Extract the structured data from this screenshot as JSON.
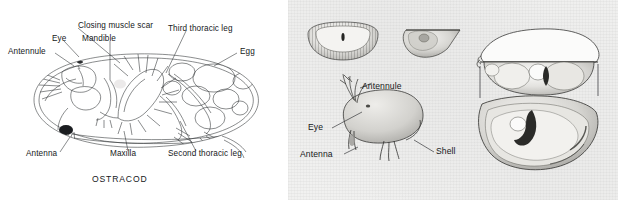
{
  "figure": {
    "caption": "OSTRACOD",
    "panels": [
      {
        "name": "anatomy-diagram",
        "kind": "line-drawing"
      },
      {
        "name": "shell-plate",
        "kind": "halftone-photo-plate"
      }
    ]
  },
  "left_panel": {
    "caption": "OSTRACOD",
    "labels": [
      {
        "id": "closing-muscle-scar",
        "text": "Closing muscle scar"
      },
      {
        "id": "eye",
        "text": "Eye"
      },
      {
        "id": "mandible",
        "text": "Mandible"
      },
      {
        "id": "third-thoracic-leg",
        "text": "Third thoracic leg"
      },
      {
        "id": "antennule",
        "text": "Antennule"
      },
      {
        "id": "egg",
        "text": "Egg"
      },
      {
        "id": "antenna",
        "text": "Antenna"
      },
      {
        "id": "maxilla",
        "text": "Maxilla"
      },
      {
        "id": "second-thoracic-leg",
        "text": "Second thoracic leg"
      }
    ]
  },
  "right_panel": {
    "labels": [
      {
        "id": "antennule",
        "text": "Antennule"
      },
      {
        "id": "eye",
        "text": "Eye"
      },
      {
        "id": "antenna",
        "text": "Antenna"
      },
      {
        "id": "shell",
        "text": "Shell"
      }
    ],
    "figures": [
      {
        "id": "shell-dorsal-inset",
        "text": ""
      },
      {
        "id": "shell-valve-inset",
        "text": ""
      },
      {
        "id": "body-side-view",
        "text": ""
      },
      {
        "id": "shell-interior-upper",
        "text": ""
      },
      {
        "id": "shell-interior-lower",
        "text": ""
      }
    ]
  },
  "colors": {
    "ink": "#16181a",
    "line": "#2b2d30",
    "paper_left": "#ffffff",
    "paper_right": "#f1f1f0",
    "shade": "#b9b9b6"
  }
}
